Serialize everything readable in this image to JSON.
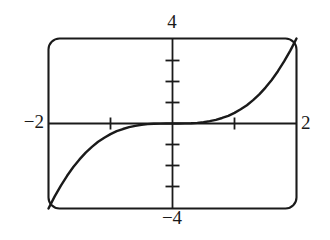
{
  "figure": {
    "kind": "graphing-calculator-plot",
    "stroke_color": "#1a1a1a",
    "background_color": "#ffffff",
    "labels": {
      "top": "4",
      "bottom": "−4",
      "left": "−2",
      "right": "2"
    }
  },
  "chart_data": {
    "type": "line",
    "title": "",
    "xlabel": "",
    "ylabel": "",
    "xlim": [
      -2,
      2
    ],
    "ylim": [
      -4,
      4
    ],
    "grid": false,
    "legend": null,
    "axis_labels": {
      "x_min": "−2",
      "x_max": "2",
      "y_min": "−4",
      "y_max": "4"
    },
    "xticks": [
      -1,
      1
    ],
    "xtick_labels": [
      "",
      ""
    ],
    "yticks": [
      -3,
      -2,
      -1,
      1,
      2,
      3
    ],
    "ytick_labels": [
      "",
      "",
      "",
      "",
      "",
      ""
    ],
    "series": [
      {
        "name": "y = x³/2",
        "x": [
          -2.0,
          -1.9,
          -1.8,
          -1.7,
          -1.6,
          -1.5,
          -1.4,
          -1.3,
          -1.2,
          -1.1,
          -1.0,
          -0.9,
          -0.8,
          -0.7,
          -0.6,
          -0.5,
          -0.4,
          -0.3,
          -0.2,
          -0.1,
          0.0,
          0.1,
          0.2,
          0.3,
          0.4,
          0.5,
          0.6,
          0.7,
          0.8,
          0.9,
          1.0,
          1.1,
          1.2,
          1.3,
          1.4,
          1.5,
          1.6,
          1.7,
          1.8,
          1.9,
          2.0
        ],
        "y": [
          -4.0,
          -3.43,
          -2.92,
          -2.46,
          -2.05,
          -1.69,
          -1.37,
          -1.1,
          -0.86,
          -0.67,
          -0.5,
          -0.36,
          -0.26,
          -0.17,
          -0.11,
          -0.06,
          -0.03,
          -0.01,
          -0.004,
          0.0,
          0.0,
          0.0,
          0.004,
          0.01,
          0.03,
          0.06,
          0.11,
          0.17,
          0.26,
          0.36,
          0.5,
          0.67,
          0.86,
          1.1,
          1.37,
          1.69,
          2.05,
          2.46,
          2.92,
          3.43,
          4.0
        ]
      }
    ]
  }
}
